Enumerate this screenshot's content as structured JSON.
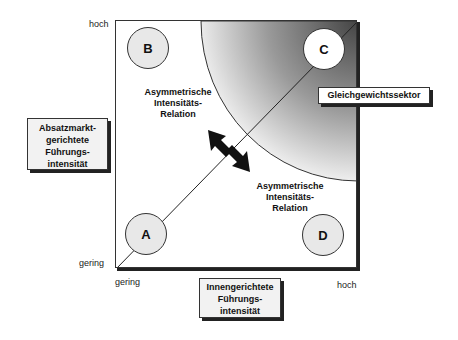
{
  "diagram": {
    "y_axis": {
      "high_label": "hoch",
      "low_label": "gering",
      "title": [
        "Absatzmarkt-",
        "gerichtete",
        "Führungs-",
        "intensität"
      ]
    },
    "x_axis": {
      "low_label": "gering",
      "high_label": "hoch",
      "title": [
        "Innengerichtete",
        "Führungs-",
        "intensität"
      ]
    },
    "quadrants": {
      "A": "A",
      "B": "B",
      "C": "C",
      "D": "D"
    },
    "relation_upper": [
      "Asymmetrische",
      "Intensitäts-",
      "Relation"
    ],
    "relation_lower": [
      "Asymmetrische",
      "Intensitäts-",
      "Relation"
    ],
    "sector_label": "Gleichgewichtssektor",
    "colors": {
      "border": "#333333",
      "circle_fill": "#e8e8e8",
      "gradient_dark": "#555555",
      "gradient_light": "#ffffff"
    }
  }
}
